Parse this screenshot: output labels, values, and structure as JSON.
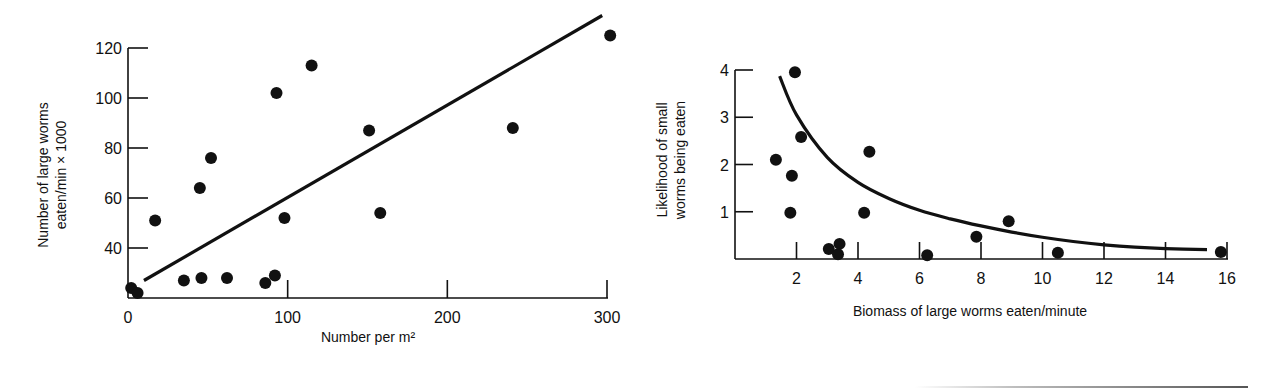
{
  "chart_data": [
    {
      "type": "scatter",
      "title": "",
      "xlabel": "Number per m²",
      "ylabel_lines": [
        "Number of large worms",
        "eaten/min × 1000"
      ],
      "ylabel": "Number of large worms eaten/min × 1000",
      "xlim": [
        0,
        300
      ],
      "ylim": [
        20,
        125
      ],
      "x_ticks": [
        0,
        100,
        200,
        300
      ],
      "x_tick_labels": [
        "0",
        "100",
        "200",
        "300"
      ],
      "y_ticks": [
        40,
        60,
        80,
        100,
        120
      ],
      "y_tick_labels": [
        "40",
        "60",
        "80",
        "100",
        "120"
      ],
      "grid": false,
      "legend": null,
      "series": [
        {
          "name": "observations",
          "type": "scatter",
          "x": [
            2,
            6,
            17,
            35,
            46,
            45,
            52,
            62,
            86,
            92,
            98,
            93,
            115,
            151,
            158,
            241,
            302
          ],
          "y": [
            24,
            22,
            51,
            27,
            28,
            64,
            76,
            28,
            26,
            29,
            52,
            102,
            113,
            87,
            54,
            88,
            125
          ]
        },
        {
          "name": "linear fit",
          "type": "line",
          "x": [
            10,
            297
          ],
          "y": [
            27,
            133
          ]
        }
      ]
    },
    {
      "type": "scatter",
      "title": "",
      "xlabel": "Biomass of large worms eaten/minute",
      "ylabel_lines": [
        "Likelihood of small",
        "worms being eaten"
      ],
      "ylabel": "Likelihood of small worms being eaten",
      "xlim": [
        0,
        16
      ],
      "ylim": [
        0,
        4
      ],
      "x_ticks": [
        2,
        4,
        6,
        8,
        10,
        12,
        14,
        16
      ],
      "x_tick_labels": [
        "2",
        "4",
        "6",
        "8",
        "10",
        "12",
        "14",
        "16"
      ],
      "y_ticks": [
        1,
        2,
        3,
        4
      ],
      "y_tick_labels": [
        "1",
        "2",
        "3",
        "4"
      ],
      "grid": false,
      "legend": null,
      "series": [
        {
          "name": "observations",
          "type": "scatter",
          "x": [
            1.95,
            2.15,
            1.33,
            1.85,
            1.8,
            4.37,
            4.2,
            3.05,
            3.4,
            3.35,
            6.25,
            7.85,
            8.9,
            10.5,
            15.8
          ],
          "y": [
            3.95,
            2.58,
            2.1,
            1.76,
            0.98,
            2.27,
            0.98,
            0.21,
            0.32,
            0.1,
            0.08,
            0.47,
            0.8,
            0.13,
            0.15
          ]
        },
        {
          "name": "fitted curve",
          "type": "line",
          "x": [
            1.45,
            2,
            3,
            4,
            5,
            6,
            7,
            8,
            9,
            10,
            11,
            12,
            13,
            14,
            15.35
          ],
          "y": [
            3.87,
            3.05,
            2.15,
            1.62,
            1.28,
            1.03,
            0.85,
            0.7,
            0.57,
            0.46,
            0.37,
            0.3,
            0.25,
            0.22,
            0.2
          ]
        }
      ]
    }
  ]
}
